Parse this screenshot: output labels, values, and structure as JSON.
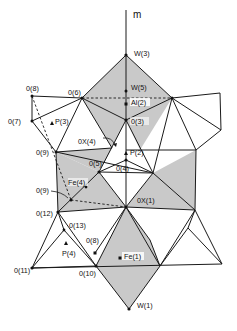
{
  "figure": {
    "axis_label": "m",
    "colors": {
      "shade": "#c9c9c9",
      "line": "#1a1a1a",
      "background": "#ffffff"
    },
    "labels": {
      "W3": "W(3)",
      "W5": "W(5)",
      "Al2": "Al(2)",
      "O3": "0(3)",
      "O6": "0(6)",
      "O8_top": "0(8)",
      "O7": "0(7)",
      "P3": "P(3)",
      "OX4": "0X(4)",
      "O9_top": "0(9)",
      "P2": "P(2)",
      "O5": "0(5)",
      "O4": "0(4)",
      "Fe4": "Fe(4)",
      "O9_low": "0(9)",
      "OX1": "0X(1)",
      "O12": "0(12)",
      "O13": "0(13)",
      "O8_low": "0(8)",
      "P4": "P(4)",
      "Fe1": "Fe(1)",
      "O11": "0(11)",
      "O10": "0(10)",
      "W1": "W(1)"
    }
  }
}
